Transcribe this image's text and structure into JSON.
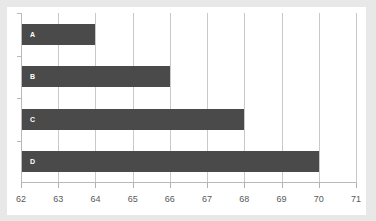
{
  "chart_data": {
    "type": "bar",
    "orientation": "horizontal",
    "title": "",
    "xlabel": "",
    "ylabel": "",
    "categories": [
      "A",
      "B",
      "C",
      "D"
    ],
    "values": [
      64,
      66,
      68,
      70
    ],
    "xlim": [
      62,
      71
    ],
    "xticks": [
      62,
      63,
      64,
      65,
      66,
      67,
      68,
      69,
      70,
      71
    ],
    "xtick_labels": [
      "62",
      "63",
      "64",
      "65",
      "66",
      "67",
      "68",
      "69",
      "70",
      "71"
    ],
    "grid": true,
    "grid_axis": "x",
    "legend": false,
    "bar_color": "#4a4a4a",
    "bar_label_color": "#ffffff",
    "gridline_color": "#c9c9c9",
    "axis_color": "#b9b9b9",
    "tick_label_color": "#595959",
    "plot_background": "#ffffff",
    "page_background": "#e8e8e8"
  }
}
